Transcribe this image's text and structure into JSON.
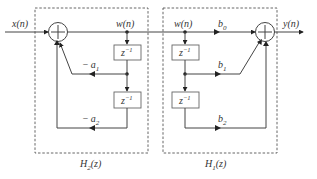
{
  "diagram": {
    "type": "signal-flow block diagram (direct-form II cascade)",
    "input_label": "x(n)",
    "output_label": "y(n)",
    "blocks": [
      {
        "name": "H2",
        "label_base": "H",
        "label_sub": "2",
        "label_arg": "(z)",
        "node_label": "w(n)",
        "delays": [
          "z",
          "z"
        ],
        "delay_exp": "−1",
        "coefficients": [
          {
            "sign": "−",
            "base": "a",
            "sub": "1"
          },
          {
            "sign": "−",
            "base": "a",
            "sub": "2"
          }
        ]
      },
      {
        "name": "H1",
        "label_base": "H",
        "label_sub": "1",
        "label_arg": "(z)",
        "node_label": "w(n)",
        "delays": [
          "z",
          "z"
        ],
        "delay_exp": "−1",
        "coefficients": [
          {
            "sign": "",
            "base": "b",
            "sub": "0"
          },
          {
            "sign": "",
            "base": "b",
            "sub": "1"
          },
          {
            "sign": "",
            "base": "b",
            "sub": "2"
          }
        ]
      }
    ],
    "adder_symbol": "+"
  }
}
